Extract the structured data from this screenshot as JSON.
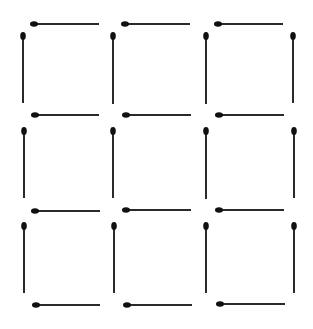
{
  "diagram": {
    "title": "",
    "colors": {
      "stick": "#2a2a2a",
      "head": "#111111",
      "background": "#ffffff"
    },
    "grid": {
      "rows": 3,
      "cols": 3
    },
    "horizontal_matches": [
      {
        "x1": 34,
        "x2": 99,
        "y": 24
      },
      {
        "x1": 125,
        "x2": 190,
        "y": 24
      },
      {
        "x1": 218,
        "x2": 283,
        "y": 24
      },
      {
        "x1": 35,
        "x2": 99,
        "y": 115
      },
      {
        "x1": 126,
        "x2": 191,
        "y": 115
      },
      {
        "x1": 219,
        "x2": 284,
        "y": 115
      },
      {
        "x1": 35,
        "x2": 100,
        "y": 211
      },
      {
        "x1": 126,
        "x2": 191,
        "y": 210
      },
      {
        "x1": 219,
        "x2": 284,
        "y": 210
      },
      {
        "x1": 36,
        "x2": 100,
        "y": 305
      },
      {
        "x1": 127,
        "x2": 192,
        "y": 305
      },
      {
        "x1": 220,
        "x2": 285,
        "y": 304
      }
    ],
    "vertical_matches": [
      {
        "x": 23,
        "y1": 36,
        "y2": 103
      },
      {
        "x": 113,
        "y1": 36,
        "y2": 104
      },
      {
        "x": 206,
        "y1": 36,
        "y2": 104
      },
      {
        "x": 293,
        "y1": 36,
        "y2": 103
      },
      {
        "x": 24,
        "y1": 131,
        "y2": 198
      },
      {
        "x": 113,
        "y1": 131,
        "y2": 198
      },
      {
        "x": 206,
        "y1": 131,
        "y2": 199
      },
      {
        "x": 294,
        "y1": 131,
        "y2": 198
      },
      {
        "x": 24,
        "y1": 226,
        "y2": 293
      },
      {
        "x": 114,
        "y1": 226,
        "y2": 293
      },
      {
        "x": 206,
        "y1": 226,
        "y2": 293
      },
      {
        "x": 294,
        "y1": 226,
        "y2": 293
      }
    ]
  }
}
